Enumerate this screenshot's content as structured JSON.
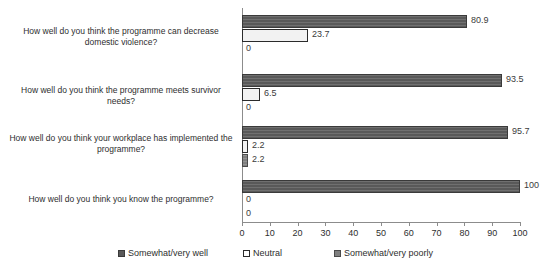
{
  "chart_data": {
    "type": "bar",
    "orientation": "horizontal",
    "title": "",
    "subtitle": "",
    "xlabel": "",
    "ylabel": "",
    "xlim": [
      0,
      100
    ],
    "grid": false,
    "legend_position": "bottom",
    "tick_labels": [
      "0",
      "10",
      "20",
      "30",
      "40",
      "50",
      "60",
      "70",
      "80",
      "90",
      "100"
    ],
    "tick_values": [
      0,
      10,
      20,
      30,
      40,
      50,
      60,
      70,
      80,
      90,
      100
    ],
    "categories": [
      "How well do you think the programme can decrease domestic violence?",
      "How well do you think the programme meets survivor needs?",
      "How well do you think your workplace has implemented the programme?",
      "How well do you think you know the programme?"
    ],
    "series": [
      {
        "name": "Somewhat/very well",
        "color": "#595959",
        "values": [
          80.9,
          93.5,
          95.7,
          100
        ],
        "labels": [
          "80.9",
          "93.5",
          "95.7",
          "100"
        ]
      },
      {
        "name": "Neutral",
        "color": "#ffffff",
        "values": [
          23.7,
          6.5,
          2.2,
          0
        ],
        "labels": [
          "23.7",
          "6.5",
          "2.2",
          "0"
        ]
      },
      {
        "name": "Somewhat/very poorly",
        "color": "#7f7f7f",
        "values": [
          0,
          0,
          2.2,
          0
        ],
        "labels": [
          "0",
          "0",
          "2.2",
          "0"
        ]
      }
    ]
  },
  "legend": {
    "items": [
      {
        "label": "Somewhat/very well"
      },
      {
        "label": "Neutral"
      },
      {
        "label": "Somewhat/very poorly"
      }
    ]
  }
}
